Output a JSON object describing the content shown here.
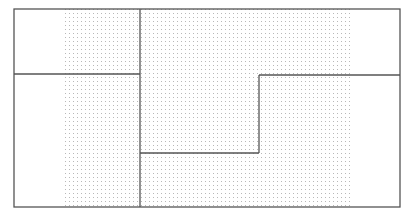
{
  "diagram": {
    "type": "region-partition",
    "outer_frame": {
      "x": 14,
      "y": 9,
      "width": 386,
      "height": 198
    },
    "dot_field": {
      "x": 62,
      "y": 9,
      "width": 288,
      "height": 198,
      "spacing": 4,
      "color": "#b8b8b8"
    },
    "line_color": "#555555",
    "lines": [
      {
        "name": "left-horizontal-divider",
        "x1": 14,
        "y1": 74,
        "x2": 140,
        "y2": 74
      },
      {
        "name": "center-vertical-divider",
        "x1": 140,
        "y1": 9,
        "x2": 140,
        "y2": 207
      },
      {
        "name": "step-bottom",
        "x1": 140,
        "y1": 153,
        "x2": 259,
        "y2": 153
      },
      {
        "name": "step-riser",
        "x1": 259,
        "y1": 153,
        "x2": 259,
        "y2": 75
      },
      {
        "name": "right-horizontal-divider",
        "x1": 259,
        "y1": 75,
        "x2": 400,
        "y2": 75
      }
    ]
  }
}
